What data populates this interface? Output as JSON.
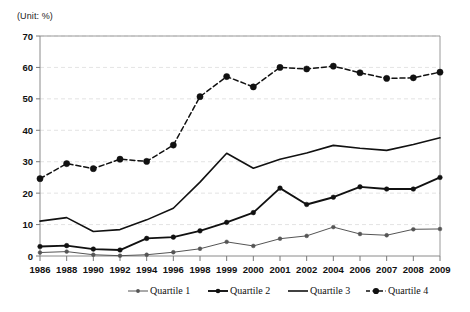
{
  "chart_data": {
    "type": "line",
    "title": "",
    "subtitle": "",
    "unit_label": "(Unit: %)",
    "xlabel": "",
    "ylabel": "",
    "ylim": [
      0,
      70
    ],
    "ytick_step": 10,
    "yticks": [
      0,
      10,
      20,
      30,
      40,
      50,
      60,
      70
    ],
    "grid": true,
    "grid_axis": "y",
    "legend_position": "bottom",
    "categories": [
      "1986",
      "1988",
      "1990",
      "1992",
      "1994",
      "1996",
      "1998",
      "1999",
      "2000",
      "2001",
      "2002",
      "2004",
      "2006",
      "2007",
      "2008",
      "2009"
    ],
    "series": [
      {
        "name": "Quartile 1",
        "style": "solid-thin-marker",
        "color": "#555555",
        "marker": "circle",
        "values": [
          1.1,
          1.4,
          0.4,
          0.1,
          0.4,
          1.2,
          2.3,
          4.5,
          3.2,
          5.5,
          6.4,
          9.2,
          7.0,
          6.6,
          8.5,
          8.6
        ]
      },
      {
        "name": "Quartile 2",
        "style": "solid-thick-marker",
        "color": "#111111",
        "marker": "circle",
        "values": [
          3.0,
          3.3,
          2.2,
          1.9,
          5.6,
          6.0,
          8.0,
          10.7,
          13.8,
          21.6,
          16.4,
          18.7,
          22.0,
          21.3,
          21.3,
          25.0
        ]
      },
      {
        "name": "Quartile 3",
        "style": "solid-plain",
        "color": "#111111",
        "marker": "none",
        "values": [
          11.1,
          12.2,
          7.8,
          8.4,
          11.5,
          15.2,
          23.5,
          32.7,
          27.9,
          30.8,
          32.8,
          35.2,
          34.3,
          33.6,
          35.5,
          37.6
        ]
      },
      {
        "name": "Quartile 4",
        "style": "dashed-marker",
        "color": "#111111",
        "marker": "circle-large",
        "values": [
          24.6,
          29.4,
          27.8,
          30.8,
          30.1,
          35.3,
          50.7,
          57.1,
          53.8,
          60.0,
          59.5,
          60.4,
          58.3,
          56.5,
          56.7,
          58.5
        ]
      }
    ]
  },
  "legend": {
    "items": [
      {
        "label": "Quartile 1"
      },
      {
        "label": "Quartile 2"
      },
      {
        "label": "Quartile 3"
      },
      {
        "label": "Quartile 4"
      }
    ]
  },
  "colors": {
    "gridline": "#dcdcdc",
    "axis": "#8a8a8a",
    "plot_border": "#9a9a9a",
    "text": "#111111",
    "series_light": "#555555",
    "series_dark": "#111111"
  }
}
